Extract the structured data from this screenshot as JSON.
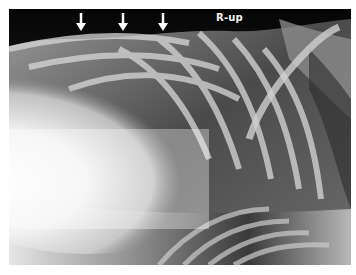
{
  "figure": {
    "type": "radiograph",
    "orientation_label": "R-up",
    "annotations": {
      "arrows": [
        {
          "name": "arrow-1",
          "x": 72,
          "y": 4
        },
        {
          "name": "arrow-2",
          "x": 114,
          "y": 4
        },
        {
          "name": "arrow-3",
          "x": 154,
          "y": 4
        }
      ],
      "arrow_color": "#ffffff"
    }
  }
}
